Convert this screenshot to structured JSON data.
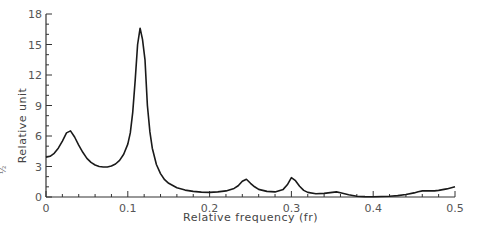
{
  "chart_data": {
    "type": "line",
    "title": "",
    "xlabel": "Relative frequency (fr)",
    "ylabel": "Relative unit",
    "xlim": [
      0,
      0.5
    ],
    "ylim": [
      0,
      18
    ],
    "x_ticks": [
      0,
      0.1,
      0.2,
      0.3,
      0.4,
      0.5
    ],
    "x_tick_labels": [
      "0",
      "0.1",
      "0.2",
      "0.3",
      "0.4",
      "0.5"
    ],
    "x_minor_step": 0.02,
    "y_ticks": [
      0,
      3,
      6,
      9,
      12,
      15,
      18
    ],
    "y_tick_labels": [
      "0",
      "3",
      "6",
      "9",
      "12",
      "15",
      "18"
    ],
    "y_minor_step": 1,
    "grid": false,
    "legend": null,
    "line_color": "#1a1a1a",
    "side_label": "½",
    "series": [
      {
        "name": "spectrum",
        "x": [
          0,
          0.005,
          0.01,
          0.015,
          0.02,
          0.025,
          0.03,
          0.035,
          0.04,
          0.045,
          0.05,
          0.055,
          0.06,
          0.065,
          0.07,
          0.075,
          0.08,
          0.085,
          0.09,
          0.095,
          0.1,
          0.103,
          0.106,
          0.109,
          0.112,
          0.115,
          0.118,
          0.121,
          0.124,
          0.127,
          0.13,
          0.135,
          0.14,
          0.145,
          0.15,
          0.16,
          0.17,
          0.18,
          0.19,
          0.2,
          0.21,
          0.22,
          0.23,
          0.235,
          0.24,
          0.245,
          0.25,
          0.255,
          0.26,
          0.27,
          0.28,
          0.29,
          0.295,
          0.3,
          0.305,
          0.31,
          0.315,
          0.32,
          0.33,
          0.34,
          0.35,
          0.355,
          0.36,
          0.37,
          0.38,
          0.39,
          0.4,
          0.41,
          0.42,
          0.43,
          0.44,
          0.45,
          0.455,
          0.46,
          0.465,
          0.47,
          0.475,
          0.48,
          0.49,
          0.5
        ],
        "y": [
          3.9,
          4.0,
          4.3,
          4.8,
          5.5,
          6.3,
          6.5,
          5.9,
          5.1,
          4.4,
          3.8,
          3.4,
          3.15,
          3.0,
          2.95,
          2.95,
          3.05,
          3.25,
          3.6,
          4.2,
          5.2,
          6.3,
          8.3,
          11.5,
          15.0,
          16.6,
          15.5,
          13.5,
          9.0,
          6.4,
          4.8,
          3.2,
          2.3,
          1.7,
          1.35,
          0.9,
          0.68,
          0.55,
          0.48,
          0.45,
          0.5,
          0.6,
          0.85,
          1.1,
          1.55,
          1.75,
          1.35,
          1.0,
          0.75,
          0.55,
          0.5,
          0.75,
          1.2,
          1.9,
          1.6,
          1.05,
          0.65,
          0.45,
          0.32,
          0.35,
          0.45,
          0.5,
          0.42,
          0.22,
          0.08,
          0.04,
          0.03,
          0.05,
          0.08,
          0.14,
          0.25,
          0.4,
          0.52,
          0.6,
          0.62,
          0.6,
          0.6,
          0.65,
          0.8,
          1.0
        ]
      }
    ]
  }
}
